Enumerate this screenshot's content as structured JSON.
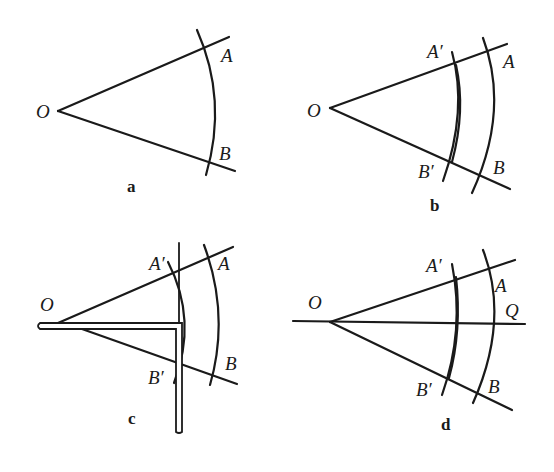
{
  "figure": {
    "panels": [
      {
        "caption": "a",
        "labels": {
          "vertex": "O",
          "point_upper": "A",
          "point_lower": "B"
        }
      },
      {
        "caption": "b",
        "labels": {
          "vertex": "O",
          "point_upper": "A",
          "point_lower": "B",
          "inner_upper": "A′",
          "inner_lower": "B′"
        }
      },
      {
        "caption": "c",
        "labels": {
          "vertex": "O",
          "point_upper": "A",
          "point_lower": "B",
          "inner_upper": "A′",
          "inner_lower": "B′"
        },
        "tool": "set-square"
      },
      {
        "caption": "d",
        "labels": {
          "vertex": "O",
          "point_upper": "A",
          "point_lower": "B",
          "inner_upper": "A′",
          "inner_lower": "B′",
          "bisector_end": "Q"
        }
      }
    ],
    "stroke_color": "#1a1a1a",
    "background": "#ffffff"
  }
}
